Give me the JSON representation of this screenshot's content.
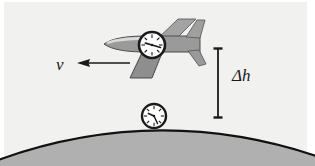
{
  "figure": {
    "name": "airplane-clock-time-dilation-diagram",
    "background_color": "#f1f1f0",
    "paper_color": "#ffffff",
    "ink_color": "#1a1a1a"
  },
  "labels": {
    "velocity": "v",
    "height_difference": "Δh"
  },
  "annotations": {
    "velocity_arrow": {
      "name": "velocity-arrow",
      "direction": "left",
      "x_start": 128,
      "x_end": 78,
      "y": 63
    },
    "height_bracket": {
      "name": "height-bracket",
      "x": 218,
      "y_top": 48,
      "y_bottom": 118
    }
  },
  "airplane": {
    "name": "airplane",
    "heading": "left",
    "body_fill": "#9a9a9a",
    "wing_fill": "#8e8e8e",
    "outline": "#3a3a3a",
    "nose_x": 104,
    "tail_x": 200,
    "center_y": 45
  },
  "clocks": [
    {
      "name": "airplane-clock",
      "cx": 152,
      "cy": 45,
      "r": 13,
      "face_color": "#ffffff",
      "rim_color": "#1a1a1a",
      "hour_angle_deg": 255,
      "minute_angle_deg": 100
    },
    {
      "name": "ground-clock",
      "cx": 154,
      "cy": 116,
      "r": 12,
      "face_color": "#ffffff",
      "rim_color": "#1a1a1a",
      "hour_angle_deg": 205,
      "minute_angle_deg": 330
    }
  ],
  "earth": {
    "name": "earth-surface",
    "fill": "#b0b0b0",
    "outline": "#111111",
    "outline_width": 2.2,
    "apex_x": 157,
    "apex_y": 127,
    "left_edge_y": 162,
    "right_edge_y": 158
  }
}
